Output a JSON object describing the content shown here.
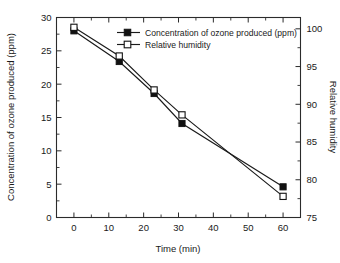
{
  "chart_data": {
    "type": "line",
    "title": "",
    "xlabel": "Time (min)",
    "ylabel": "Concentration of ozone produced (ppm)",
    "y2label": "Relative humidity",
    "x": [
      0,
      13,
      23,
      31,
      60
    ],
    "xlim": [
      -5,
      65
    ],
    "xticks": [
      0,
      10,
      20,
      30,
      40,
      50,
      60
    ],
    "xtick_labels": [
      "0",
      "10",
      "20",
      "30",
      "40",
      "50",
      "60"
    ],
    "ylim": [
      0,
      30
    ],
    "yticks": [
      0,
      5,
      10,
      15,
      20,
      25,
      30
    ],
    "ytick_labels": [
      "0",
      "5",
      "10",
      "15",
      "20",
      "25",
      "30"
    ],
    "y2lim": [
      75,
      101.5
    ],
    "y2ticks": [
      75,
      80,
      85,
      90,
      95,
      100
    ],
    "y2tick_labels": [
      "75",
      "80",
      "85",
      "90",
      "95",
      "100"
    ],
    "grid": false,
    "legend_position": "upper-center",
    "series": [
      {
        "name": "Concentration of ozone produced (ppm)",
        "axis": "left",
        "marker": "filled-square",
        "color": "#111111",
        "values": [
          28.0,
          23.4,
          18.6,
          14.1,
          4.6
        ]
      },
      {
        "name": "Relative humidity",
        "axis": "right",
        "marker": "open-square",
        "color": "#111111",
        "values": [
          100.2,
          96.4,
          91.9,
          88.6,
          77.8
        ]
      }
    ]
  },
  "legend": {
    "items": [
      {
        "label": "Concentration of ozone produced (ppm)",
        "marker": "filled-square"
      },
      {
        "label": "Relative humidity",
        "marker": "open-square"
      }
    ]
  },
  "axes": {
    "x_title": "Time (min)",
    "y_left_title": "Concentration of ozone produced (ppm)",
    "y_right_title": "Relative humidity"
  }
}
